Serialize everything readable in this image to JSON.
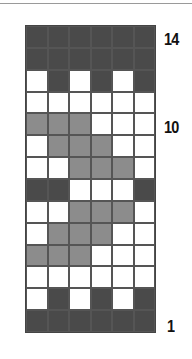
{
  "colors": {
    "D": "#4a4a4a",
    "M": "#8c8c8c",
    "W": "#ffffff"
  },
  "chart": {
    "columns": 6,
    "rows_top_to_bottom": [
      [
        "D",
        "D",
        "D",
        "D",
        "D",
        "D"
      ],
      [
        "D",
        "D",
        "D",
        "D",
        "D",
        "D"
      ],
      [
        "W",
        "D",
        "W",
        "D",
        "W",
        "D"
      ],
      [
        "W",
        "W",
        "W",
        "W",
        "W",
        "W"
      ],
      [
        "M",
        "M",
        "M",
        "W",
        "W",
        "W"
      ],
      [
        "W",
        "M",
        "M",
        "M",
        "W",
        "W"
      ],
      [
        "W",
        "W",
        "M",
        "M",
        "M",
        "W"
      ],
      [
        "D",
        "D",
        "W",
        "W",
        "W",
        "D"
      ],
      [
        "W",
        "W",
        "M",
        "M",
        "M",
        "W"
      ],
      [
        "W",
        "M",
        "M",
        "M",
        "W",
        "W"
      ],
      [
        "M",
        "M",
        "M",
        "W",
        "W",
        "W"
      ],
      [
        "W",
        "W",
        "W",
        "W",
        "W",
        "W"
      ],
      [
        "W",
        "D",
        "W",
        "D",
        "W",
        "D"
      ],
      [
        "D",
        "D",
        "D",
        "D",
        "D",
        "D"
      ]
    ]
  },
  "row_labels": [
    {
      "text": "14",
      "row": 14
    },
    {
      "text": "10",
      "row": 10
    },
    {
      "text": "1",
      "row": 1
    }
  ]
}
